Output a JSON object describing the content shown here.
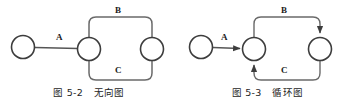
{
  "page": {
    "width": 357,
    "height": 111,
    "background": "#ffffff",
    "ink": "#4a4a4a",
    "text_color": "#1b1b1b"
  },
  "figures": [
    {
      "id": "undirected-graph",
      "caption_number": "图 5-2",
      "caption_title": "无向图",
      "graph_type": "undirected",
      "nodes": [
        {
          "id": "n1",
          "cx": 23,
          "cy": 47,
          "r": 11.5
        },
        {
          "id": "n2",
          "cx": 89,
          "cy": 49,
          "r": 11.5
        },
        {
          "id": "n3",
          "cx": 152,
          "cy": 49,
          "r": 11.5
        }
      ],
      "edges": [
        {
          "label": "A",
          "from": "n1",
          "to": "n2",
          "directed": false,
          "label_x": 58,
          "label_y": 37
        },
        {
          "label": "B",
          "from": "n2",
          "to": "n3",
          "directed": false,
          "label_x": 117,
          "label_y": 9
        },
        {
          "label": "C",
          "from": "n2",
          "to": "n3",
          "directed": false,
          "label_x": 117,
          "label_y": 70
        }
      ]
    },
    {
      "id": "cyclic-graph",
      "caption_number": "图 5-3",
      "caption_title": "循环图",
      "graph_type": "directed",
      "nodes": [
        {
          "id": "m1",
          "cx": 23,
          "cy": 47,
          "r": 11.5
        },
        {
          "id": "m2",
          "cx": 76,
          "cy": 49,
          "r": 11.5
        },
        {
          "id": "m3",
          "cx": 142,
          "cy": 49,
          "r": 11.5
        }
      ],
      "edges": [
        {
          "label": "A",
          "from": "m1",
          "to": "m2",
          "directed": true,
          "label_x": 45,
          "label_y": 37
        },
        {
          "label": "B",
          "from": "m2",
          "to": "m3",
          "directed": true,
          "label_x": 105,
          "label_y": 9
        },
        {
          "label": "C",
          "from": "m3",
          "to": "m2",
          "directed": true,
          "label_x": 105,
          "label_y": 70
        }
      ]
    }
  ]
}
